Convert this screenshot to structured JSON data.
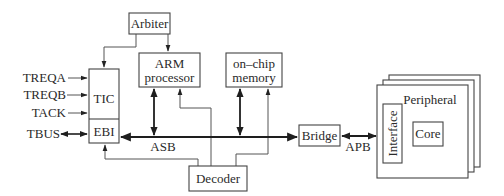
{
  "diagram": {
    "type": "block-diagram",
    "title": "",
    "blocks": {
      "arbiter": "Arbiter",
      "arm_line1": "ARM",
      "arm_line2": "processor",
      "mem_line1": "on–chip",
      "mem_line2": "memory",
      "tic": "TIC",
      "ebi": "EBI",
      "decoder": "Decoder",
      "bridge": "Bridge",
      "peripheral": "Peripheral",
      "interface": "Interface",
      "core": "Core"
    },
    "signals": {
      "treqa": "TREQA",
      "treqb": "TREQB",
      "tack": "TACK",
      "tbus": "TBUS"
    },
    "buses": {
      "asb": "ASB",
      "apb": "APB"
    },
    "colors": {
      "line": "#444444",
      "bus": "#1e1e1e",
      "background": "#ffffff"
    }
  }
}
